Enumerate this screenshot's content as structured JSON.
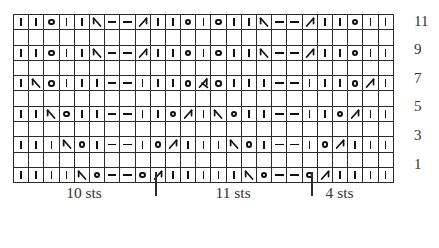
{
  "chart": {
    "columns": 25,
    "rows": 11,
    "legend_symbols": {
      "knit": "vertical-bar",
      "purl": "horizontal-dash",
      "yarn_over": "open-circle",
      "ssk": "left-leaning-decrease",
      "k2tog": "right-leaning-decrease",
      "cdd": "centered-double-decrease"
    },
    "row_numbers": [
      "11",
      "9",
      "7",
      "5",
      "3",
      "1"
    ],
    "grid": [
      {
        "label": "11",
        "cells": [
          "knit",
          "knit",
          "yo",
          "knit",
          "knit",
          "ssk",
          "dash",
          "dash",
          "k2tog",
          "knit",
          "knit",
          "yo",
          "knit",
          "yo",
          "knit",
          "knit",
          "ssk",
          "dash",
          "dash",
          "k2tog",
          "knit",
          "knit",
          "yo",
          "knit",
          "knit"
        ]
      },
      {
        "label": "",
        "cells": [
          "blank",
          "blank",
          "blank",
          "blank",
          "blank",
          "blank",
          "blank",
          "blank",
          "blank",
          "blank",
          "blank",
          "blank",
          "blank",
          "blank",
          "blank",
          "blank",
          "blank",
          "blank",
          "blank",
          "blank",
          "blank",
          "blank",
          "blank",
          "blank",
          "blank"
        ]
      },
      {
        "label": "9",
        "cells": [
          "knit",
          "knit",
          "yo",
          "knit",
          "knit",
          "ssk",
          "dash",
          "dash",
          "k2tog",
          "knit",
          "knit",
          "yo",
          "knit",
          "yo",
          "knit",
          "knit",
          "ssk",
          "dash",
          "dash",
          "k2tog",
          "knit",
          "knit",
          "yo",
          "knit",
          "knit"
        ]
      },
      {
        "label": "",
        "cells": [
          "blank",
          "blank",
          "blank",
          "blank",
          "blank",
          "blank",
          "blank",
          "blank",
          "blank",
          "blank",
          "blank",
          "blank",
          "blank",
          "blank",
          "blank",
          "blank",
          "blank",
          "blank",
          "blank",
          "blank",
          "blank",
          "blank",
          "blank",
          "blank",
          "blank"
        ]
      },
      {
        "label": "7",
        "cells": [
          "knit",
          "ssk",
          "yo",
          "knit",
          "knit",
          "knit",
          "dash",
          "dash",
          "knit",
          "knit",
          "knit",
          "yo",
          "cdd",
          "yo",
          "knit",
          "knit",
          "knit",
          "dash",
          "dash",
          "knit",
          "knit",
          "knit",
          "yo",
          "k2tog",
          "knit"
        ]
      },
      {
        "label": "",
        "cells": [
          "blank",
          "blank",
          "blank",
          "blank",
          "blank",
          "blank",
          "blank",
          "blank",
          "blank",
          "blank",
          "blank",
          "blank",
          "blank",
          "blank",
          "blank",
          "blank",
          "blank",
          "blank",
          "blank",
          "blank",
          "blank",
          "blank",
          "blank",
          "blank",
          "blank"
        ]
      },
      {
        "label": "5",
        "cells": [
          "knit",
          "knit",
          "ssk",
          "yo",
          "knit",
          "knit",
          "dash",
          "dash",
          "knit",
          "knit",
          "yo",
          "k2tog",
          "knit",
          "ssk",
          "yo",
          "knit",
          "knit",
          "dash",
          "dash",
          "knit",
          "knit",
          "yo",
          "k2tog",
          "knit",
          "knit"
        ]
      },
      {
        "label": "",
        "cells": [
          "blank",
          "blank",
          "blank",
          "blank",
          "blank",
          "blank",
          "blank",
          "blank",
          "blank",
          "blank",
          "blank",
          "blank",
          "blank",
          "blank",
          "blank",
          "blank",
          "blank",
          "blank",
          "blank",
          "blank",
          "blank",
          "blank",
          "blank",
          "blank",
          "blank"
        ]
      },
      {
        "label": "3",
        "cells": [
          "knit",
          "knit",
          "knit",
          "ssk",
          "yo",
          "knit",
          "dash",
          "dash",
          "knit",
          "yo",
          "k2tog",
          "knit",
          "knit",
          "knit",
          "ssk",
          "yo",
          "knit",
          "dash",
          "dash",
          "knit",
          "yo",
          "k2tog",
          "knit",
          "knit",
          "knit"
        ]
      },
      {
        "label": "",
        "cells": [
          "blank",
          "blank",
          "blank",
          "blank",
          "blank",
          "blank",
          "blank",
          "blank",
          "blank",
          "blank",
          "blank",
          "blank",
          "blank",
          "blank",
          "blank",
          "blank",
          "blank",
          "blank",
          "blank",
          "blank",
          "blank",
          "blank",
          "blank",
          "blank",
          "blank"
        ]
      },
      {
        "label": "1",
        "cells": [
          "knit",
          "knit",
          "knit",
          "knit",
          "ssk",
          "yo",
          "dash",
          "dash",
          "yo",
          "k2tog",
          "knit",
          "knit",
          "knit",
          "knit",
          "knit",
          "ssk",
          "yo",
          "dash",
          "dash",
          "yo",
          "k2tog",
          "knit",
          "knit",
          "knit",
          "knit"
        ]
      }
    ],
    "repeats": [
      {
        "label": "10 sts",
        "start_col": 0,
        "end_col": 10
      },
      {
        "label": "11 sts",
        "start_col": 10,
        "end_col": 21
      },
      {
        "label": "4 sts",
        "start_col": 21,
        "end_col": 25
      }
    ]
  }
}
